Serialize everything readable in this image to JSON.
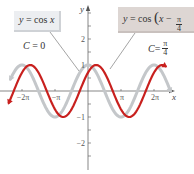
{
  "chart_data": {
    "type": "line",
    "title": "",
    "xlabel": "x",
    "ylabel": "y",
    "xlim_pi": [
      -2.4,
      2.6
    ],
    "ylim": [
      -2.3,
      3.5
    ],
    "x_ticks": [
      {
        "value_pi": -2,
        "label": "−2π"
      },
      {
        "value_pi": -1,
        "label": "−π"
      },
      {
        "value_pi": 1,
        "label": "π"
      },
      {
        "value_pi": 2,
        "label": "2π"
      }
    ],
    "y_ticks": [
      {
        "value": 2,
        "label": "2"
      },
      {
        "value": 1,
        "label": "1"
      },
      {
        "value": -1,
        "label": "−1"
      },
      {
        "value": -2,
        "label": "−2"
      }
    ],
    "y_minor_step": 0.5,
    "series": [
      {
        "name": "y = cos x",
        "function": "cos(x)",
        "phase_shift_pi": 0,
        "x_range_pi": [
          -2.35,
          2.5
        ],
        "color": "#c4c7ca"
      },
      {
        "name": "y = cos(x − π/4)",
        "function": "cos(x - pi/4)",
        "phase_shift_pi": 0.25,
        "x_range_pi": [
          -2.4,
          2.35
        ],
        "color": "#c8201e"
      }
    ],
    "annotations": [
      {
        "text": "y = cos x",
        "target": "gray curve"
      },
      {
        "text": "y = cos(x − π/4)",
        "target": "red curve"
      },
      {
        "text": "C = 0"
      },
      {
        "text": "C = π/4"
      }
    ],
    "grid": false,
    "legend": "none"
  },
  "labels": {
    "left_box": {
      "y": "y",
      "eq": " = cos ",
      "x": "x"
    },
    "right_box": {
      "y": "y",
      "eq": " = cos ",
      "x": "x",
      "minus": " − ",
      "num": "π",
      "den": "4"
    },
    "c_left": {
      "c": "C",
      "eq": " = 0"
    },
    "c_right": {
      "c": "C",
      "eq": " = ",
      "num": "π",
      "den": "4"
    }
  },
  "colors": {
    "axis": "#555555",
    "gray_curve": "#c4c7ca",
    "red_curve": "#c8201e",
    "leader": "#666666"
  }
}
